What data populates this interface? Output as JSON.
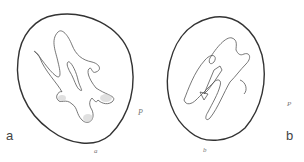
{
  "figure": {
    "panels": [
      {
        "label": "a",
        "sub_label": "a",
        "side_label": "P"
      },
      {
        "label": "b",
        "sub_label": "b",
        "side_label": "P"
      }
    ]
  }
}
